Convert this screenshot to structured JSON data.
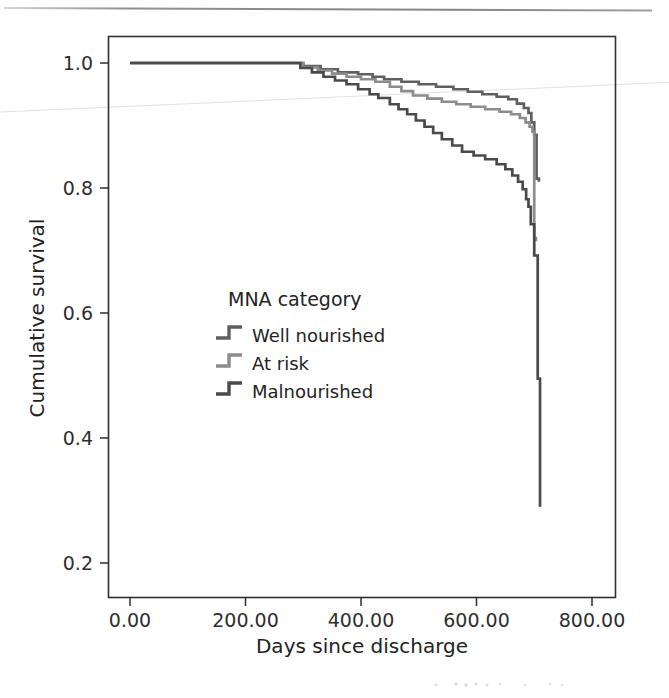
{
  "figure": {
    "name": "kaplan-meier-survival-figure",
    "background": "#ffffff"
  },
  "chart_data": {
    "type": "line",
    "subtype": "kaplan-meier-step",
    "title": "",
    "xlabel": "Days since discharge",
    "ylabel": "Cumulative survival",
    "xlim": [
      -40,
      840
    ],
    "ylim": [
      0.14,
      1.035
    ],
    "xticks": [
      0,
      200,
      400,
      600,
      800
    ],
    "xtick_labels": [
      "0.00",
      "200.00",
      "400.00",
      "600.00",
      "800.00"
    ],
    "yticks": [
      0.2,
      0.4,
      0.6,
      0.8,
      1.0
    ],
    "ytick_labels": [
      "0.2",
      "0.4",
      "0.6",
      "0.8",
      "1.0"
    ],
    "grid": false,
    "legend_position": "inside-center-left",
    "legend_title": "MNA category",
    "series": [
      {
        "name": "Well nourished",
        "color": "#5f5f5f",
        "x": [
          0,
          285,
          300,
          330,
          360,
          395,
          420,
          440,
          470,
          500,
          530,
          560,
          585,
          610,
          635,
          655,
          670,
          682,
          690,
          695,
          700,
          704,
          708
        ],
        "y": [
          1.0,
          1.0,
          0.995,
          0.99,
          0.985,
          0.982,
          0.978,
          0.974,
          0.97,
          0.966,
          0.962,
          0.958,
          0.954,
          0.95,
          0.946,
          0.942,
          0.935,
          0.928,
          0.92,
          0.905,
          0.885,
          0.815,
          0.81
        ]
      },
      {
        "name": "At risk",
        "color": "#8c8c8c",
        "x": [
          0,
          280,
          300,
          325,
          350,
          375,
          400,
          425,
          450,
          470,
          490,
          515,
          540,
          565,
          590,
          615,
          640,
          660,
          675,
          685,
          692,
          697,
          700,
          703
        ],
        "y": [
          1.0,
          1.0,
          0.993,
          0.988,
          0.983,
          0.978,
          0.974,
          0.97,
          0.962,
          0.955,
          0.948,
          0.943,
          0.938,
          0.934,
          0.93,
          0.926,
          0.922,
          0.918,
          0.912,
          0.905,
          0.898,
          0.89,
          0.72,
          0.715
        ]
      },
      {
        "name": "Malnourished",
        "color": "#4a4a4a",
        "x": [
          0,
          275,
          295,
          315,
          335,
          355,
          375,
          395,
          415,
          430,
          450,
          465,
          480,
          495,
          510,
          525,
          540,
          558,
          575,
          595,
          615,
          635,
          650,
          662,
          672,
          680,
          686,
          690,
          694,
          700,
          706,
          710
        ],
        "y": [
          1.0,
          1.0,
          0.992,
          0.985,
          0.978,
          0.972,
          0.966,
          0.958,
          0.95,
          0.944,
          0.934,
          0.926,
          0.918,
          0.908,
          0.898,
          0.888,
          0.878,
          0.868,
          0.858,
          0.852,
          0.846,
          0.838,
          0.83,
          0.82,
          0.81,
          0.798,
          0.782,
          0.77,
          0.742,
          0.692,
          0.495,
          0.29
        ]
      }
    ]
  },
  "legend": {
    "title": "MNA category",
    "items": [
      {
        "label": "Well nourished",
        "color": "#5f5f5f"
      },
      {
        "label": "At risk",
        "color": "#8c8c8c"
      },
      {
        "label": "Malnourished",
        "color": "#4a4a4a"
      }
    ]
  },
  "axes": {
    "x_title": "Days since discharge",
    "y_title": "Cumulative survival"
  }
}
